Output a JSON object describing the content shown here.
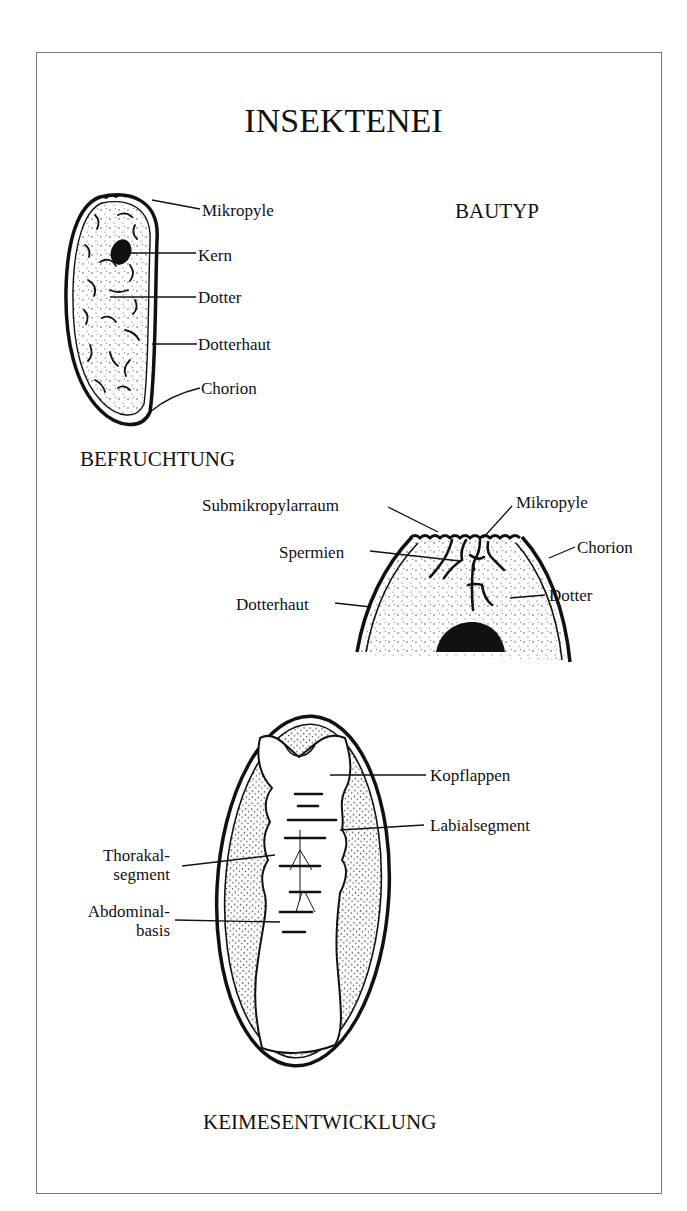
{
  "title": "INSEKTENEI",
  "sections": {
    "bautyp": "BAUTYP",
    "befruchtung": "BEFRUCHTUNG",
    "keimesentwicklung": "KEIMESENTWICKLUNG"
  },
  "diagrams": {
    "bautyp": {
      "labels": [
        "Mikropyle",
        "Kern",
        "Dotter",
        "Dotterhaut",
        "Chorion"
      ]
    },
    "befruchtung": {
      "labels": [
        "Submikropylarraum",
        "Mikropyle",
        "Spermien",
        "Chorion",
        "Dotterhaut",
        "Dotter"
      ]
    },
    "keimesentwicklung": {
      "labels": [
        "Kopflappen",
        "Labialsegment",
        "Thorakal-",
        "segment",
        "Abdominal-",
        "basis"
      ]
    }
  },
  "colors": {
    "ink": "#111111",
    "frame": "#777777",
    "background": "#ffffff"
  }
}
